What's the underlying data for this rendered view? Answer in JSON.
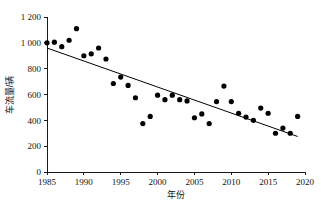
{
  "chart_data": {
    "type": "scatter",
    "title": "",
    "xlabel": "年份",
    "ylabel": "车流量/辆",
    "xlim": [
      1985,
      2020
    ],
    "ylim": [
      0,
      1200
    ],
    "grid": false,
    "legend": "none",
    "x_ticks": [
      "1985",
      "1990",
      "1995",
      "2000",
      "2005",
      "2010",
      "2015",
      "2020"
    ],
    "x_tick_values": [
      1985,
      1990,
      1995,
      2000,
      2005,
      2010,
      2015,
      2020
    ],
    "y_ticks": [
      "0",
      "200",
      "400",
      "600",
      "800",
      "1 000",
      "1 200"
    ],
    "y_tick_values": [
      0,
      200,
      400,
      600,
      800,
      1000,
      1200
    ],
    "marker": "filled-circle",
    "marker_color": "#000000",
    "points": [
      {
        "x": 1985,
        "y": 1000
      },
      {
        "x": 1986,
        "y": 1005
      },
      {
        "x": 1987,
        "y": 970
      },
      {
        "x": 1988,
        "y": 1020
      },
      {
        "x": 1989,
        "y": 1110
      },
      {
        "x": 1990,
        "y": 900
      },
      {
        "x": 1991,
        "y": 915
      },
      {
        "x": 1992,
        "y": 960
      },
      {
        "x": 1993,
        "y": 875
      },
      {
        "x": 1994,
        "y": 685
      },
      {
        "x": 1995,
        "y": 735
      },
      {
        "x": 1996,
        "y": 670
      },
      {
        "x": 1997,
        "y": 575
      },
      {
        "x": 1998,
        "y": 375
      },
      {
        "x": 1999,
        "y": 430
      },
      {
        "x": 2000,
        "y": 595
      },
      {
        "x": 2001,
        "y": 560
      },
      {
        "x": 2002,
        "y": 595
      },
      {
        "x": 2003,
        "y": 560
      },
      {
        "x": 2004,
        "y": 550
      },
      {
        "x": 2005,
        "y": 420
      },
      {
        "x": 2006,
        "y": 450
      },
      {
        "x": 2007,
        "y": 375
      },
      {
        "x": 2008,
        "y": 545
      },
      {
        "x": 2009,
        "y": 665
      },
      {
        "x": 2010,
        "y": 545
      },
      {
        "x": 2011,
        "y": 455
      },
      {
        "x": 2012,
        "y": 425
      },
      {
        "x": 2013,
        "y": 400
      },
      {
        "x": 2014,
        "y": 495
      },
      {
        "x": 2015,
        "y": 455
      },
      {
        "x": 2016,
        "y": 300
      },
      {
        "x": 2017,
        "y": 340
      },
      {
        "x": 2018,
        "y": 300
      },
      {
        "x": 2019,
        "y": 430
      }
    ],
    "trendline": {
      "type": "linear-fit",
      "x_start": 1985,
      "y_start": 960,
      "x_end": 2019,
      "y_end": 275
    }
  }
}
